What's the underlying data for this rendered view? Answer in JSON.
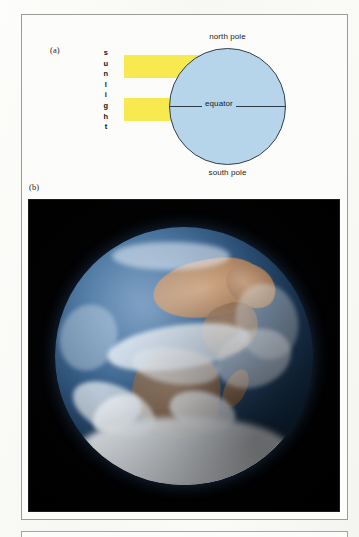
{
  "figure": {
    "panels": [
      {
        "id": "a",
        "label": "(a)"
      },
      {
        "id": "b",
        "label": "(b)"
      }
    ]
  },
  "diagram": {
    "sunlight_label": "sunlight",
    "sunlight_letters": [
      "s",
      "u",
      "n",
      "l",
      "i",
      "g",
      "h",
      "t"
    ],
    "north_pole_label": "north pole",
    "south_pole_label": "south pole",
    "equator_label": "equator",
    "colors": {
      "sunbeam": "#f7e94f",
      "earth_fill": "#b6d4ea",
      "earth_outline": "#33404c",
      "equator_line": "#2d3b47"
    },
    "sunbeam_count": 2
  },
  "photo": {
    "subject": "earth-from-space",
    "description": "Full-disc photograph of Earth showing Africa, the Arabian peninsula, Madagascar, cloud systems and Antarctic ice",
    "background_color": "#000000",
    "globe_colors": {
      "ocean": "#24486f",
      "land": "#b98a62",
      "cloud": "#f2f5f8",
      "ice": "#ffffff"
    }
  }
}
